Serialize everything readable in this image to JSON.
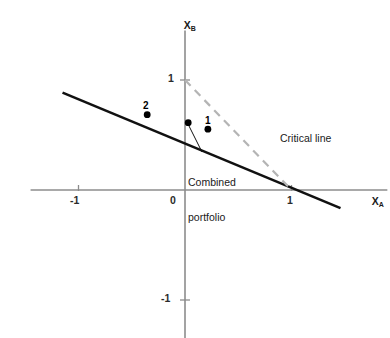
{
  "chart_data": {
    "type": "line",
    "title": "",
    "xlabel": "X_A",
    "ylabel": "X_B",
    "xlim": [
      -1.45,
      1.9
    ],
    "ylim": [
      -1.35,
      1.45
    ],
    "grid": false,
    "legend": "none",
    "axis_labels": {
      "x_base": "X",
      "x_sub": "A",
      "y_base": "X",
      "y_sub": "B"
    },
    "xticks": [
      -1,
      0,
      1
    ],
    "xtick_labels": [
      "-1",
      "0",
      "1"
    ],
    "yticks": [
      1,
      -1
    ],
    "ytick_labels": [
      "1",
      "-1"
    ],
    "origin_label": "0",
    "series": [
      {
        "name": "Critical line",
        "style": "solid",
        "color": "#111111",
        "width": 2.6,
        "points": [
          [
            -1.15,
            0.885
          ],
          [
            1.46,
            -0.165
          ]
        ]
      },
      {
        "name": "Budget constraint",
        "style": "dashed",
        "color": "#b4b4b4",
        "width": 2.2,
        "points": [
          [
            0.0,
            1.0
          ],
          [
            1.0,
            0.0
          ]
        ]
      }
    ],
    "points": [
      {
        "label": "2",
        "x": -0.355,
        "y": 0.685,
        "label_dx": -2,
        "label_dy": -13
      },
      {
        "label": "",
        "x": 0.03,
        "y": 0.612,
        "label_dx": 0,
        "label_dy": 0
      },
      {
        "label": "1",
        "x": 0.215,
        "y": 0.553,
        "label_dx": -2,
        "label_dy": -13
      }
    ],
    "annotations": [
      {
        "name": "critical-line-label",
        "text": "Critical line",
        "x_px": 280,
        "y_px": 133
      },
      {
        "name": "combined-portfolio-label",
        "line1": "Combined",
        "line2": "portfolio",
        "x_px": 188,
        "y_px": 153
      }
    ],
    "leader_line": {
      "from": [
        188,
        124
      ],
      "to": [
        202,
        152
      ],
      "color": "#111111",
      "width": 1
    },
    "colors": {
      "axis": "#8c8c8c",
      "critical_line": "#111111",
      "constraint_line": "#b4b4b4",
      "marker": "#000000",
      "text": "#1a1a1a",
      "background": "#ffffff"
    }
  }
}
